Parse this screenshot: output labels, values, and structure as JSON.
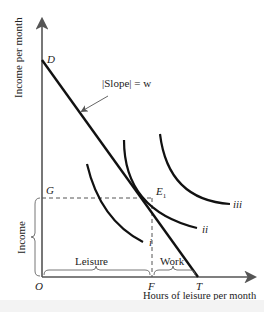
{
  "diagram": {
    "y_axis_label": "Income per month",
    "x_axis_label": "Hours of leisure per month",
    "points": {
      "origin": "O",
      "intercept_y": "D",
      "intercept_x": "T",
      "equilibrium": "E",
      "equilibrium_sub": "1",
      "income_level": "G",
      "leisure_level": "F"
    },
    "slope_annotation": "|Slope| = w",
    "curves": [
      {
        "name": "i"
      },
      {
        "name": "ii"
      },
      {
        "name": "iii"
      }
    ],
    "braces": {
      "income": "Income",
      "leisure": "Leisure",
      "work": "Work"
    },
    "colors": {
      "axis": "#555555",
      "line": "#111111",
      "text": "#222222",
      "dashed": "#555555"
    }
  }
}
